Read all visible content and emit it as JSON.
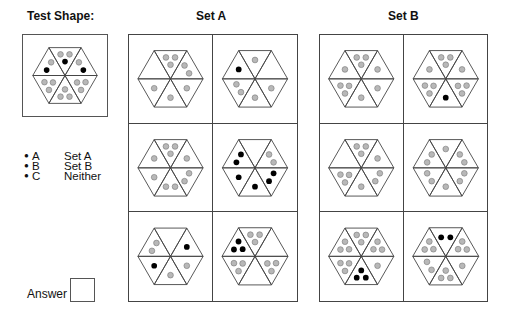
{
  "test": {
    "title": "Test Shape:",
    "shape": {
      "tl": [
        "g",
        "b"
      ],
      "t": [
        "g",
        "g",
        "b"
      ],
      "tr": [
        "b",
        "g"
      ],
      "br": [
        "g",
        "g",
        "g"
      ],
      "b": [
        "g",
        "g",
        "g"
      ],
      "bl": [
        "g",
        "g",
        "g"
      ]
    }
  },
  "setA": {
    "title": "Set A",
    "shapes": [
      {
        "tl": [],
        "t": [
          "g",
          "g",
          "g"
        ],
        "tr": [
          "g",
          "g"
        ],
        "br": [
          "g"
        ],
        "b": [
          "g"
        ],
        "bl": [
          "g"
        ]
      },
      {
        "tl": [
          "b"
        ],
        "t": [
          "g"
        ],
        "tr": [],
        "br": [
          "g"
        ],
        "b": [
          "g"
        ],
        "bl": [
          "g",
          "g"
        ]
      },
      {
        "tl": [
          "g"
        ],
        "t": [
          "g",
          "g",
          "g"
        ],
        "tr": [
          "g"
        ],
        "br": [
          "g",
          "g"
        ],
        "b": [
          "g",
          "g"
        ],
        "bl": [
          "g"
        ]
      },
      {
        "tl": [
          "b",
          "b"
        ],
        "t": [],
        "tr": [
          "g",
          "g"
        ],
        "br": [
          "b",
          "b"
        ],
        "b": [
          "b"
        ],
        "bl": [
          "b"
        ]
      },
      {
        "tl": [
          "g",
          "g"
        ],
        "t": [],
        "tr": [
          "b"
        ],
        "br": [
          "g"
        ],
        "b": [
          "g"
        ],
        "bl": [
          "b"
        ]
      },
      {
        "tl": [
          "b",
          "b",
          "b"
        ],
        "t": [
          "g",
          "g",
          "g"
        ],
        "tr": [],
        "br": [
          "g",
          "g",
          "g"
        ],
        "b": [],
        "bl": [
          "g",
          "g",
          "g"
        ]
      }
    ]
  },
  "setB": {
    "title": "Set B",
    "shapes": [
      {
        "tl": [
          "g"
        ],
        "t": [
          "g",
          "g",
          "g"
        ],
        "tr": [
          "g"
        ],
        "br": [
          "g"
        ],
        "b": [
          "g"
        ],
        "bl": [
          "g",
          "g",
          "g"
        ]
      },
      {
        "tl": [
          "g"
        ],
        "t": [
          "g",
          "g",
          "g"
        ],
        "tr": [
          "g"
        ],
        "br": [
          "g",
          "g",
          "g"
        ],
        "b": [
          "b"
        ],
        "bl": [
          "g",
          "g",
          "g"
        ]
      },
      {
        "tl": [],
        "t": [
          "g",
          "g",
          "g"
        ],
        "tr": [
          "g"
        ],
        "br": [
          "g",
          "g"
        ],
        "b": [
          "g"
        ],
        "bl": [
          "g",
          "g",
          "g"
        ]
      },
      {
        "tl": [
          "g",
          "g"
        ],
        "t": [
          "g"
        ],
        "tr": [
          "g",
          "g"
        ],
        "br": [
          "g",
          "g"
        ],
        "b": [
          "g"
        ],
        "bl": [
          "g",
          "g"
        ]
      },
      {
        "tl": [
          "g",
          "g",
          "g"
        ],
        "t": [
          "g",
          "g",
          "g"
        ],
        "tr": [
          "g",
          "g",
          "g"
        ],
        "br": [
          "g"
        ],
        "b": [
          "b",
          "b",
          "b"
        ],
        "bl": [
          "g",
          "g",
          "g"
        ]
      },
      {
        "tl": [
          "g",
          "g",
          "g"
        ],
        "t": [
          "b",
          "b"
        ],
        "tr": [
          "g",
          "g",
          "g"
        ],
        "br": [
          "g"
        ],
        "b": [
          "g",
          "g",
          "g"
        ],
        "bl": [
          "g",
          "g"
        ]
      }
    ]
  },
  "options": [
    {
      "letter": "A",
      "label": "Set A"
    },
    {
      "letter": "B",
      "label": "Set B"
    },
    {
      "letter": "C",
      "label": "Neither"
    }
  ],
  "answer": {
    "label": "Answer",
    "value": ""
  },
  "colors": {
    "grey_dot": "#b8b8b8",
    "black_dot": "#000000",
    "line": "#444444"
  }
}
